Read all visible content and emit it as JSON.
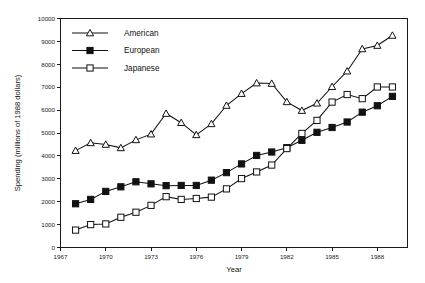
{
  "chart_data": {
    "type": "line",
    "title": "",
    "xlabel": "Year",
    "ylabel": "Spending (millions of 1988 dollars)",
    "xlim": [
      1967,
      1990
    ],
    "ylim": [
      0,
      10000
    ],
    "grid": false,
    "legend_position": "top-left",
    "x_ticks": [
      "1967",
      "1970",
      "1973",
      "1976",
      "1979",
      "1982",
      "1985",
      "1988"
    ],
    "x_tick_values": [
      1967,
      1970,
      1973,
      1976,
      1979,
      1982,
      1985,
      1988
    ],
    "y_ticks": [
      "0",
      "1000",
      "2000",
      "3000",
      "4000",
      "5000",
      "6000",
      "7000",
      "8000",
      "9000",
      "10000"
    ],
    "y_tick_values": [
      0,
      1000,
      2000,
      3000,
      4000,
      5000,
      6000,
      7000,
      8000,
      9000,
      10000
    ],
    "x": [
      1968,
      1969,
      1970,
      1971,
      1972,
      1973,
      1974,
      1975,
      1976,
      1977,
      1978,
      1979,
      1980,
      1981,
      1982,
      1983,
      1984,
      1985,
      1986,
      1987,
      1988,
      1989
    ],
    "series": [
      {
        "name": "American",
        "marker": "open-triangle",
        "values": [
          4230,
          4570,
          4500,
          4350,
          4700,
          4950,
          5850,
          5450,
          4920,
          5400,
          6200,
          6720,
          7180,
          7160,
          6360,
          5980,
          6300,
          7020,
          7700,
          8670,
          8820,
          9260
        ]
      },
      {
        "name": "European",
        "marker": "filled-square",
        "values": [
          1910,
          2100,
          2450,
          2650,
          2870,
          2780,
          2700,
          2710,
          2710,
          2940,
          3270,
          3650,
          4020,
          4170,
          4360,
          4680,
          5030,
          5240,
          5480,
          5910,
          6190,
          6600
        ]
      },
      {
        "name": "Japanese",
        "marker": "open-square",
        "values": [
          760,
          1000,
          1030,
          1320,
          1540,
          1840,
          2220,
          2100,
          2140,
          2200,
          2560,
          3010,
          3300,
          3600,
          4320,
          4980,
          5550,
          6350,
          6680,
          6500,
          7010,
          7010
        ]
      }
    ]
  },
  "legend": {
    "items": [
      {
        "label": "American"
      },
      {
        "label": "European"
      },
      {
        "label": "Japanese"
      }
    ]
  },
  "colors": {
    "ink": "#111111",
    "background": "#ffffff"
  }
}
